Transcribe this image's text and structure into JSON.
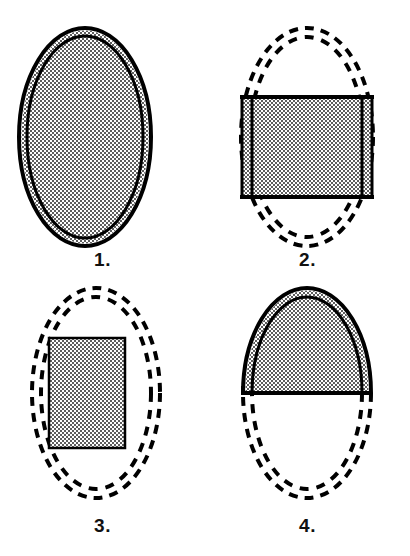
{
  "figure": {
    "background_color": "#ffffff",
    "ink_color": "#000000",
    "stipple_color": "#6e6e6e",
    "width": 410,
    "height": 556,
    "columns": 2,
    "rows": 2
  },
  "panels": [
    {
      "id": "panel-1",
      "label": "1.",
      "description": "Whole ellipse fully shaded, solid outer outline with inner solid ellipse line",
      "outline_style": "solid",
      "fill": "stipple",
      "fill_region": "entire-ellipse",
      "fill_fraction": 1.0,
      "ellipse": {
        "cx": 85,
        "cy": 137,
        "rx": 66,
        "ry": 109
      },
      "inner_ellipse": {
        "cx": 85,
        "cy": 137,
        "rx": 58,
        "ry": 101
      },
      "has_rectangle": false,
      "has_midline": false
    },
    {
      "id": "panel-2",
      "label": "2.",
      "description": "Dashed double ellipse outline with a shaded horizontal band across the middle",
      "outline_style": "dashed",
      "fill": "stipple",
      "fill_region": "horizontal-band",
      "fill_fraction": 0.47,
      "ellipse": {
        "cx": 102,
        "cy": 137,
        "rx": 66,
        "ry": 109
      },
      "inner_ellipse": {
        "cx": 102,
        "cy": 137,
        "rx": 58,
        "ry": 101
      },
      "band": {
        "x": 36,
        "y": 96,
        "width": 132,
        "height": 102
      },
      "band_inner_edges": [
        46,
        158
      ],
      "has_rectangle": true,
      "has_midline": false
    },
    {
      "id": "panel-3",
      "label": "3.",
      "description": "Dashed double ellipse outline with an inscribed shaded rectangle",
      "outline_style": "dashed",
      "fill": "stipple",
      "fill_region": "inscribed-rectangle",
      "fill_fraction": 0.42,
      "ellipse": {
        "cx": 96,
        "cy": 115,
        "rx": 64,
        "ry": 105
      },
      "inner_ellipse": {
        "cx": 96,
        "cy": 115,
        "rx": 56,
        "ry": 97
      },
      "rectangle": {
        "x": 49,
        "y": 60,
        "width": 76,
        "height": 110
      },
      "has_rectangle": true,
      "has_midline": false
    },
    {
      "id": "panel-4",
      "label": "4.",
      "description": "Upper half of the ellipse solid and shaded, lower half dashed outline, solid midline",
      "outline_style": "half-solid-half-dashed",
      "fill": "stipple",
      "fill_region": "upper-half",
      "fill_fraction": 0.5,
      "ellipse": {
        "cx": 102,
        "cy": 115,
        "rx": 64,
        "ry": 105
      },
      "inner_ellipse": {
        "cx": 102,
        "cy": 115,
        "rx": 56,
        "ry": 97
      },
      "midline": {
        "x1": 38,
        "x2": 166,
        "y": 115
      },
      "has_rectangle": false,
      "has_midline": true
    }
  ],
  "legend": {
    "solid_outline_meaning": "solid outline",
    "dashed_outline_meaning": "dashed outline",
    "stipple_meaning": "shaded region"
  }
}
